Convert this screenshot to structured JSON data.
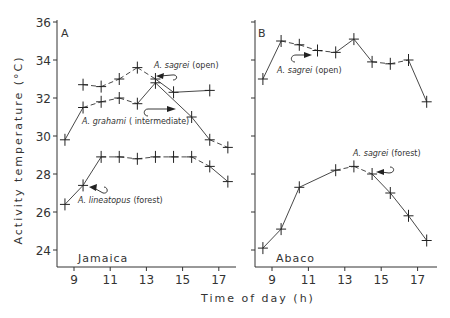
{
  "chart_data": [
    {
      "type": "line",
      "panel": "A",
      "site": "Jamaica",
      "xlabel": "Time of day (h)",
      "ylabel": "Activity temperature (°C)",
      "xticks": [
        9,
        11,
        13,
        15,
        17
      ],
      "yticks": [
        24,
        26,
        28,
        30,
        32,
        34,
        36
      ],
      "ylim": [
        23,
        36
      ],
      "xlim": [
        8,
        18
      ],
      "series": [
        {
          "name": "A. sagrei (open)",
          "x": [
            9.5,
            10.5,
            11.5,
            12.5,
            13.5,
            14.5,
            16.5
          ],
          "values": [
            32.7,
            32.6,
            33.0,
            33.6,
            33.0,
            32.3,
            32.4
          ]
        },
        {
          "name": "A. grahami (intermediate)",
          "x": [
            8.5,
            9.5,
            10.5,
            11.5,
            12.5,
            13.5,
            15.5,
            16.5,
            17.5
          ],
          "values": [
            29.8,
            31.5,
            31.8,
            32.0,
            31.7,
            32.8,
            31.0,
            29.8,
            29.4
          ]
        },
        {
          "name": "A. lineatopus (forest)",
          "x": [
            8.5,
            9.5,
            10.5,
            11.5,
            12.5,
            13.5,
            14.5,
            15.5,
            16.5,
            17.5
          ],
          "values": [
            26.4,
            27.4,
            28.9,
            28.9,
            28.8,
            28.9,
            28.9,
            28.9,
            28.4,
            27.6
          ]
        }
      ]
    },
    {
      "type": "line",
      "panel": "B",
      "site": "Abaco",
      "xlabel": "Time of day (h)",
      "ylabel": "Activity temperature (°C)",
      "xticks": [
        9,
        11,
        13,
        15,
        17
      ],
      "yticks": [
        24,
        26,
        28,
        30,
        32,
        34,
        36
      ],
      "ylim": [
        23,
        36
      ],
      "xlim": [
        8,
        18
      ],
      "series": [
        {
          "name": "A. sagrei (open)",
          "x": [
            8.5,
            9.5,
            10.5,
            11.5,
            12.5,
            13.5,
            14.5,
            15.5,
            16.5,
            17.5
          ],
          "values": [
            33.0,
            35.0,
            34.8,
            34.5,
            34.4,
            35.1,
            33.9,
            33.8,
            34.0,
            31.8
          ]
        },
        {
          "name": "A. sagrei (forest)",
          "x": [
            8.5,
            9.5,
            10.5,
            12.5,
            13.5,
            14.5,
            15.5,
            16.5,
            17.5
          ],
          "values": [
            24.1,
            25.1,
            27.3,
            28.2,
            28.4,
            28.0,
            27.0,
            25.8,
            24.5
          ]
        }
      ]
    }
  ],
  "labels": {
    "ylabel": "Activity temperature (°C)",
    "xlabel": "Time of day (h)",
    "panel_a": "A",
    "panel_b": "B",
    "site_a": "Jamaica",
    "site_b": "Abaco",
    "a_sagrei_open_genus": "A. sagrei",
    "a_sagrei_open_hab": "(open)",
    "a_grahami_genus": "A. grahami",
    "a_grahami_hab": "( intermediate)",
    "a_lineatopus_genus": "A. lineatopus",
    "a_lineatopus_hab": "(forest)",
    "b_sagrei_open_genus": "A. sagrei",
    "b_sagrei_open_hab": "(open)",
    "b_sagrei_forest_genus": "A. sagrei",
    "b_sagrei_forest_hab": "(forest)"
  }
}
